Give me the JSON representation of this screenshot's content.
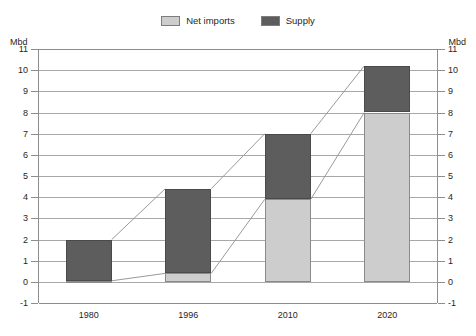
{
  "legend": {
    "items": [
      {
        "label": "Net imports",
        "color": "#cdcdcd",
        "key": "net_imports"
      },
      {
        "label": "Supply",
        "color": "#5d5d5d",
        "key": "supply"
      }
    ]
  },
  "axis": {
    "unit_left": "Mbd",
    "unit_right": "Mbd"
  },
  "chart_data": {
    "type": "bar",
    "title": "",
    "subtitle": "",
    "xlabel": "",
    "ylabel": "Mbd",
    "ylim": [
      -1,
      11
    ],
    "ytick_step": 1,
    "grid": true,
    "stacked": true,
    "legend_position": "top-center",
    "categories": [
      "1980",
      "1996",
      "2010",
      "2020"
    ],
    "ytick_labels": [
      "11",
      "10",
      "9",
      "8",
      "7",
      "6",
      "5",
      "4",
      "3",
      "2",
      "1",
      "0",
      "-1"
    ],
    "series": [
      {
        "name": "Net imports",
        "color": "#cdcdcd",
        "values": [
          0.05,
          0.4,
          3.9,
          8.0
        ]
      },
      {
        "name": "Supply",
        "color": "#5d5d5d",
        "values": [
          1.95,
          4.0,
          3.1,
          2.2
        ]
      }
    ],
    "bar_totals": [
      2.0,
      4.4,
      7.0,
      10.2
    ],
    "annotations": "Thin connector lines join the tops of successive bars and the tops of successive net-import segments.",
    "connectors": [
      {
        "name": "total-connector",
        "points": [
          [
            0,
            2.0
          ],
          [
            1,
            4.4
          ],
          [
            2,
            7.0
          ],
          [
            3,
            10.2
          ]
        ]
      },
      {
        "name": "net-imports-connector",
        "points": [
          [
            0,
            0.05
          ],
          [
            1,
            0.4
          ],
          [
            2,
            3.9
          ],
          [
            3,
            8.0
          ]
        ]
      }
    ]
  }
}
